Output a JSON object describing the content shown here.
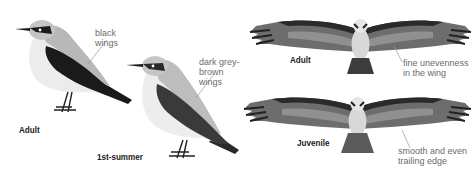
{
  "left_panel": {
    "species_group": "wheatear",
    "adult": {
      "caption": "Adult",
      "annotation": "black\nwings"
    },
    "first_summer": {
      "caption": "1st-summer",
      "annotation": "dark grey-\nbrown\nwings"
    }
  },
  "right_panel": {
    "species_group": "osprey",
    "adult": {
      "caption": "Adult",
      "annotation": "fine unevenness\nin the wing"
    },
    "juvenile": {
      "caption": "Juvenile",
      "annotation": "smooth and even\ntrailing edge"
    }
  },
  "colors": {
    "background": "#ffffff",
    "annotation_text": "#6b6b6b",
    "caption_text": "#222222",
    "leader_line": "#999999",
    "wheatear_back": "#b8b8b8",
    "wheatear_breast": "#ececec",
    "wheatear_wing_black": "#1a1a1a",
    "wheatear_wing_greybrown": "#3a3a3a",
    "osprey_wing": "#6d6d6d",
    "osprey_dark": "#2a2a2a",
    "osprey_body": "#d8d8d8"
  }
}
